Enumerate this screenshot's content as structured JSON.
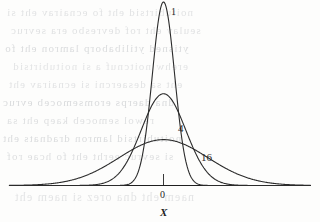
{
  "figure": {
    "background_color": "#fdfdfc",
    "ink_color": "#2b2b2b",
    "ghost_text_color": "#b9bcc0"
  },
  "axis": {
    "origin_label": "0",
    "x_label": "X",
    "tick_label": "0"
  },
  "labels": {
    "curve_1": "1",
    "curve_2": "4",
    "curve_3": "16"
  },
  "ghost_text": {
    "lines": [
      "noitubirtsid eht fo ecnairav eht si",
      "seulav eht rof devresbo era sevruc",
      "ytisned ytilibaborp lamron eht fo",
      "erehw noitcnuf a si noitubirtsid",
      "eht sa desaercni si ecnairav eht",
      "dna daerps eromsemoceb evruc",
      "rewol semoceb kaep eht sa",
      "noitubirtsid lamron dradnats eht",
      "si sevruc eerht eht fo hcae rof",
      "naem eht dna orez si naem eht"
    ]
  },
  "chart_data": {
    "type": "line",
    "title": "",
    "xlabel": "X",
    "ylabel": "",
    "grid": false,
    "legend": "inline-annotations",
    "xlim": [
      -12,
      12
    ],
    "ylim": [
      0,
      0.42
    ],
    "xticks": [
      0
    ],
    "xticklabels": [
      "0"
    ],
    "series": [
      {
        "name": "1",
        "label": "1",
        "mean": 0,
        "variance": 1,
        "sigma": 1,
        "peak_value": 0.3989,
        "label_position": {
          "x": 172,
          "y": 12
        },
        "x": [
          -12,
          -10,
          -8,
          -6,
          -5,
          -4,
          -3.5,
          -3,
          -2.5,
          -2,
          -1.5,
          -1,
          -0.5,
          0,
          0.5,
          1,
          1.5,
          2,
          2.5,
          3,
          3.5,
          4,
          5,
          6,
          8,
          10,
          12
        ],
        "y": [
          0.0,
          0.0,
          0.0,
          0.0,
          1.5e-06,
          0.0001338,
          0.0008727,
          0.0044318,
          0.0175283,
          0.053991,
          0.1295176,
          0.2419707,
          0.3520653,
          0.3989423,
          0.3520653,
          0.2419707,
          0.1295176,
          0.053991,
          0.0175283,
          0.0044318,
          0.0008727,
          0.0001338,
          1.5e-06,
          0.0,
          0.0,
          0.0,
          0.0
        ]
      },
      {
        "name": "4",
        "label": "4",
        "mean": 0,
        "variance": 4,
        "sigma": 2,
        "peak_value": 0.1995,
        "label_position": {
          "x": 181,
          "y": 124
        },
        "x": [
          -12,
          -10,
          -9,
          -8,
          -7,
          -6,
          -5,
          -4,
          -3,
          -2,
          -1,
          0,
          1,
          2,
          3,
          4,
          5,
          6,
          7,
          8,
          9,
          10,
          12
        ],
        "y": [
          1.8e-06,
          8.67e-05,
          0.0002291,
          0.000534,
          0.0011087,
          0.0064758,
          0.0129518,
          0.0269955,
          0.0647588,
          0.1209854,
          0.1760327,
          0.1994711,
          0.1760327,
          0.1209854,
          0.0647588,
          0.0269955,
          0.0129518,
          0.0064758,
          0.0011087,
          0.000534,
          0.0002291,
          8.67e-05,
          1.8e-06
        ]
      },
      {
        "name": "16",
        "label": "16",
        "mean": 0,
        "variance": 16,
        "sigma": 4,
        "peak_value": 0.0997,
        "label_position": {
          "x": 203,
          "y": 152
        },
        "x": [
          -16,
          -14,
          -12,
          -10,
          -8,
          -6,
          -4,
          -2,
          0,
          2,
          4,
          6,
          8,
          10,
          12,
          14,
          16
        ],
        "y": [
          0.0001338,
          0.0006476,
          0.0024958,
          0.0075949,
          0.0179969,
          0.0329533,
          0.0604927,
          0.0880163,
          0.0997356,
          0.0880163,
          0.0604927,
          0.0329533,
          0.0179969,
          0.0075949,
          0.0024958,
          0.0006476,
          0.0001338
        ]
      }
    ]
  }
}
